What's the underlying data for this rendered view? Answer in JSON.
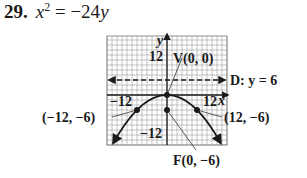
{
  "problem": {
    "number": "29.",
    "equation_lhs_var": "x",
    "equation_lhs_exp": "2",
    "equation_rhs": "= −24",
    "equation_rhs_var": "y"
  },
  "graph": {
    "axis_x_label": "x",
    "axis_y_label": "y",
    "tick_labels": {
      "y_pos": "12",
      "y_neg": "−12",
      "x_neg": "−12",
      "x_pos": "12"
    },
    "vertex_label": "V(0, 0)",
    "directrix_label": "D: y = 6",
    "focus_label": "F(0, −6)",
    "left_point_label": "(−12, −6)",
    "right_point_label": "(12, −6)"
  },
  "chart_data": {
    "type": "line",
    "xlabel": "x",
    "ylabel": "y",
    "xlim": [
      -24,
      24
    ],
    "ylim": [
      -20,
      24
    ],
    "grid": true,
    "series": [
      {
        "name": "parabola x^2 = -24y",
        "x": [
          -24,
          -12,
          0,
          12,
          24
        ],
        "y": [
          -24,
          -6,
          0,
          -6,
          -24
        ]
      },
      {
        "name": "directrix y = 6",
        "x": [
          -24,
          24
        ],
        "y": [
          6,
          6
        ],
        "style": "dashed"
      }
    ],
    "points": [
      {
        "label": "V(0, 0)",
        "x": 0,
        "y": 0
      },
      {
        "label": "F(0, −6)",
        "x": 0,
        "y": -6
      },
      {
        "label": "(−12, −6)",
        "x": -12,
        "y": -6
      },
      {
        "label": "(12, −6)",
        "x": 12,
        "y": -6
      }
    ],
    "annotations": [
      "D: y = 6",
      "V(0, 0)",
      "F(0, −6)",
      "(−12, −6)",
      "(12, −6)"
    ]
  }
}
